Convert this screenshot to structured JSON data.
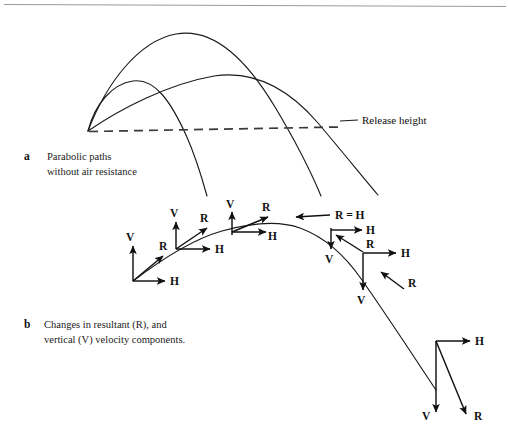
{
  "figure": {
    "title_visible": false,
    "background_color": "#ffffff",
    "ink_color": "#1a1a1a",
    "top_rule": {
      "name": "page-top-rule",
      "color": "#9a9a9a"
    }
  },
  "panel_a": {
    "marker": "a",
    "caption_lines": [
      "Parabolic paths",
      "without air resistance"
    ],
    "release_height_label": "Release height",
    "trajectories": [
      {
        "name": "steep-short-path",
        "note": "high angle, short range"
      },
      {
        "name": "optimal-path",
        "note": "tallest peak, mid range"
      },
      {
        "name": "shallow-long-path",
        "note": "low angle, longest range"
      }
    ]
  },
  "panel_b": {
    "marker": "b",
    "caption_lines": [
      "Changes in resultant (R), and",
      "vertical (V) velocity components."
    ],
    "apex_label": "R = H",
    "labels": {
      "vertical": "V",
      "horizontal": "H",
      "resultant": "R"
    },
    "vector_clusters": [
      {
        "name": "cluster-launch",
        "labels": [
          "V",
          "H",
          "R"
        ]
      },
      {
        "name": "cluster-rising-early",
        "labels": [
          "V",
          "H",
          "R"
        ]
      },
      {
        "name": "cluster-rising-late",
        "labels": [
          "V",
          "H",
          "R"
        ]
      },
      {
        "name": "cluster-apex",
        "labels": [
          "R = H"
        ]
      },
      {
        "name": "cluster-falling-early",
        "labels": [
          "V",
          "H",
          "R"
        ]
      },
      {
        "name": "cluster-falling-mid",
        "labels": [
          "V",
          "H",
          "R"
        ]
      },
      {
        "name": "cluster-falling-late",
        "labels": [
          "V",
          "H",
          "R"
        ]
      }
    ]
  }
}
